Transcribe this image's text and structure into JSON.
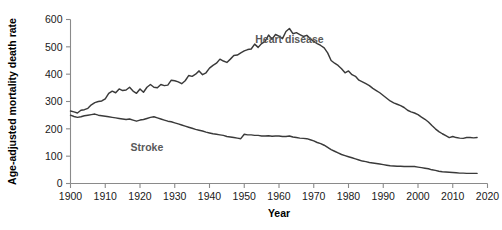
{
  "chart_data": {
    "type": "line",
    "title": "",
    "xlabel": "Year",
    "ylabel": "Age-adjusted mortality death rate",
    "xlim": [
      1900,
      2020
    ],
    "ylim": [
      0,
      600
    ],
    "grid": false,
    "legend_position": "inline-labels",
    "xticks": [
      1900,
      1910,
      1920,
      1930,
      1940,
      1950,
      1960,
      1970,
      1980,
      1990,
      2000,
      2010,
      2020
    ],
    "yticks": [
      0,
      100,
      200,
      300,
      400,
      500,
      600
    ],
    "xtick_labels": [
      "1900",
      "1910",
      "1920",
      "1930",
      "1940",
      "1950",
      "1960",
      "1970",
      "1980",
      "1990",
      "2000",
      "2010",
      "2020"
    ],
    "ytick_labels": [
      "0",
      "100",
      "200",
      "300",
      "400",
      "500",
      "600"
    ],
    "line_color": "#3a3a3a",
    "label_color": "#595959",
    "axis_color": "#8a8a8a",
    "x": [
      1900,
      1901,
      1902,
      1903,
      1904,
      1905,
      1906,
      1907,
      1908,
      1909,
      1910,
      1911,
      1912,
      1913,
      1914,
      1915,
      1916,
      1917,
      1918,
      1919,
      1920,
      1921,
      1922,
      1923,
      1924,
      1925,
      1926,
      1927,
      1928,
      1929,
      1930,
      1931,
      1932,
      1933,
      1934,
      1935,
      1936,
      1937,
      1938,
      1939,
      1940,
      1941,
      1942,
      1943,
      1944,
      1945,
      1946,
      1947,
      1948,
      1949,
      1950,
      1951,
      1952,
      1953,
      1954,
      1955,
      1956,
      1957,
      1958,
      1959,
      1960,
      1961,
      1962,
      1963,
      1964,
      1965,
      1966,
      1967,
      1968,
      1969,
      1970,
      1971,
      1972,
      1973,
      1974,
      1975,
      1976,
      1977,
      1978,
      1979,
      1980,
      1981,
      1982,
      1983,
      1984,
      1985,
      1986,
      1987,
      1988,
      1989,
      1990,
      1991,
      1992,
      1993,
      1994,
      1995,
      1996,
      1997,
      1998,
      1999,
      2000,
      2001,
      2002,
      2003,
      2004,
      2005,
      2006,
      2007,
      2008,
      2009,
      2010,
      2011,
      2012,
      2013,
      2014,
      2015,
      2016,
      2017
    ],
    "series": [
      {
        "name": "Heart disease",
        "label_x": 1963,
        "label_y": 515,
        "values": [
          265,
          262,
          258,
          268,
          270,
          275,
          288,
          296,
          300,
          302,
          310,
          330,
          338,
          332,
          346,
          340,
          342,
          352,
          338,
          330,
          346,
          334,
          352,
          362,
          352,
          350,
          362,
          358,
          360,
          378,
          376,
          372,
          365,
          376,
          395,
          392,
          400,
          412,
          398,
          405,
          422,
          432,
          440,
          455,
          448,
          443,
          455,
          468,
          470,
          478,
          485,
          490,
          492,
          510,
          498,
          512,
          520,
          543,
          528,
          545,
          539,
          530,
          556,
          567,
          548,
          552,
          545,
          538,
          542,
          530,
          520,
          512,
          505,
          496,
          478,
          450,
          440,
          432,
          420,
          405,
          412,
          398,
          392,
          378,
          372,
          365,
          358,
          348,
          340,
          332,
          322,
          312,
          302,
          295,
          290,
          285,
          278,
          268,
          262,
          258,
          252,
          243,
          235,
          225,
          212,
          200,
          190,
          182,
          175,
          168,
          172,
          168,
          166,
          165,
          168,
          168,
          167,
          168
        ]
      },
      {
        "name": "Stroke",
        "label_x": 1922,
        "label_y": 118,
        "values": [
          250,
          245,
          242,
          244,
          248,
          250,
          252,
          254,
          250,
          248,
          246,
          244,
          242,
          240,
          238,
          236,
          234,
          236,
          232,
          228,
          232,
          234,
          238,
          242,
          244,
          240,
          236,
          232,
          228,
          226,
          222,
          218,
          214,
          210,
          206,
          202,
          198,
          195,
          192,
          188,
          185,
          182,
          180,
          178,
          176,
          172,
          170,
          168,
          166,
          164,
          180,
          178,
          178,
          176,
          176,
          174,
          174,
          175,
          173,
          174,
          174,
          172,
          172,
          174,
          170,
          168,
          166,
          165,
          164,
          160,
          156,
          150,
          146,
          140,
          132,
          124,
          118,
          112,
          106,
          102,
          98,
          94,
          90,
          86,
          82,
          80,
          77,
          75,
          73,
          71,
          69,
          67,
          65,
          64,
          63,
          63,
          62,
          62,
          62,
          62,
          60,
          58,
          56,
          54,
          50,
          48,
          45,
          43,
          42,
          41,
          40,
          39,
          38,
          38,
          37,
          37,
          37,
          37
        ]
      }
    ]
  }
}
